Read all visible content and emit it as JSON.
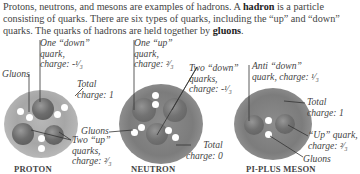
{
  "intro": {
    "text_1": "Protons, neutrons, and mesons are examples of hadrons. A ",
    "bold_1": "hadron",
    "text_2": " is a particle consisting of quarks. There are six types of quarks, including the “up” and “down” quarks. The quarks of hadrons are held together by ",
    "bold_2": "gluons",
    "text_3": "."
  },
  "proton": {
    "caption": "PROTON",
    "down_quark_label": [
      "One “down”",
      "quark,",
      "charge: -¹⁄₃"
    ],
    "gluons_label": "Gluons",
    "total_label": [
      "Total",
      "charge: 1"
    ],
    "up_quarks_label": [
      "Two “up”",
      "quarks,",
      "charge: ²⁄₃"
    ]
  },
  "neutron": {
    "caption": "NEUTRON",
    "up_quark_label": [
      "One “up”",
      "quark,",
      "charge: ²⁄₃"
    ],
    "down_quarks_label": [
      "Two “down”",
      "quarks,",
      "charge: -¹⁄₃"
    ],
    "gluons_label": "Gluons",
    "total_label": [
      "Total",
      "charge: 0"
    ]
  },
  "meson": {
    "caption": "PI-PLUS MESON",
    "anti_down_label": [
      "Anti “down”",
      "quark, charge: ¹⁄₃"
    ],
    "total_label": [
      "Total",
      "charge: 1"
    ],
    "up_quark_label": [
      "“Up” quark,",
      "charge: ²⁄₃"
    ],
    "gluons_label": "Gluons"
  }
}
